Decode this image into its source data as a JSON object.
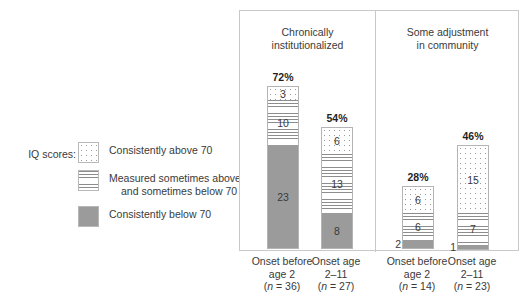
{
  "legend": {
    "title": "IQ scores:",
    "items": [
      {
        "label_line1": "Consistently above 70",
        "label_line2": "",
        "pattern": "dots"
      },
      {
        "label_line1": "Measured sometimes above",
        "label_line2": "and sometimes below 70",
        "pattern": "lines"
      },
      {
        "label_line1": "Consistently below 70",
        "label_line2": "",
        "pattern": "solid"
      }
    ]
  },
  "panels": [
    {
      "title_line1": "Chronically",
      "title_line2": "institutionalized"
    },
    {
      "title_line1": "Some adjustment",
      "title_line2": "in community"
    }
  ],
  "colors": {
    "solid_gray": "#9b9b9b",
    "hatch_gray": "#8d8d8d",
    "dot_gray": "#9a9a9a",
    "border": "#b4b4b4",
    "frame": "#c9c9c9",
    "text": "#3a3a3a"
  },
  "chart_data": {
    "type": "bar",
    "title": "",
    "subtype": "stacked-bar",
    "xlabel": "",
    "ylabel": "",
    "ylim": [
      0,
      100
    ],
    "grid": false,
    "legend_position": "left",
    "legend_entries": [
      "Consistently above 70",
      "Measured sometimes above and sometimes below 70",
      "Consistently below 70"
    ],
    "groups": [
      "Chronically institutionalized",
      "Some adjustment in community"
    ],
    "categories": [
      "Onset before age 2 (n = 36)",
      "Onset age 2-11 (n = 27)",
      "Onset before age 2 (n = 14)",
      "Onset age 2-11 (n = 23)"
    ],
    "series": [
      {
        "name": "Consistently above 70",
        "pattern": "dots",
        "values": [
          3,
          6,
          6,
          15
        ]
      },
      {
        "name": "Measured sometimes above and sometimes below 70",
        "pattern": "lines",
        "values": [
          10,
          13,
          6,
          7
        ]
      },
      {
        "name": "Consistently below 70",
        "pattern": "solid",
        "values": [
          23,
          8,
          2,
          1
        ]
      }
    ],
    "totals_pct": [
      "72%",
      "54%",
      "28%",
      "46%"
    ],
    "bars": [
      {
        "group": 0,
        "total_label": "72%",
        "total_pct": 72,
        "n": 36,
        "x_line1": "Onset before",
        "x_line2": "age 2",
        "x_n_prefix": "(",
        "x_n_italic": "n",
        "x_n_suffix": " = 36)",
        "segments": [
          {
            "value": 3,
            "pattern": "dots",
            "label": "3",
            "label_outside": false
          },
          {
            "value": 10,
            "pattern": "lines",
            "label": "10",
            "label_outside": false
          },
          {
            "value": 23,
            "pattern": "solid",
            "label": "23",
            "label_outside": false
          }
        ]
      },
      {
        "group": 0,
        "total_label": "54%",
        "total_pct": 54,
        "n": 27,
        "x_line1": "Onset age",
        "x_line2": "2–11",
        "x_n_prefix": "(",
        "x_n_italic": "n",
        "x_n_suffix": " = 27)",
        "segments": [
          {
            "value": 6,
            "pattern": "dots",
            "label": "6",
            "label_outside": false
          },
          {
            "value": 13,
            "pattern": "lines",
            "label": "13",
            "label_outside": false
          },
          {
            "value": 8,
            "pattern": "solid",
            "label": "8",
            "label_outside": false
          }
        ]
      },
      {
        "group": 1,
        "total_label": "28%",
        "total_pct": 28,
        "n": 14,
        "x_line1": "Onset before",
        "x_line2": "age 2",
        "x_n_prefix": "(",
        "x_n_italic": "n",
        "x_n_suffix": " = 14)",
        "segments": [
          {
            "value": 6,
            "pattern": "dots",
            "label": "6",
            "label_outside": false
          },
          {
            "value": 6,
            "pattern": "lines",
            "label": "6",
            "label_outside": false
          },
          {
            "value": 2,
            "pattern": "solid",
            "label": "2",
            "label_outside": true
          }
        ]
      },
      {
        "group": 1,
        "total_label": "46%",
        "total_pct": 46,
        "n": 23,
        "x_line1": "Onset age",
        "x_line2": "2–11",
        "x_n_prefix": "(",
        "x_n_italic": "n",
        "x_n_suffix": " = 23)",
        "segments": [
          {
            "value": 15,
            "pattern": "dots",
            "label": "15",
            "label_outside": false
          },
          {
            "value": 7,
            "pattern": "lines",
            "label": "7",
            "label_outside": false
          },
          {
            "value": 1,
            "pattern": "solid",
            "label": "1",
            "label_outside": true
          }
        ]
      }
    ]
  }
}
